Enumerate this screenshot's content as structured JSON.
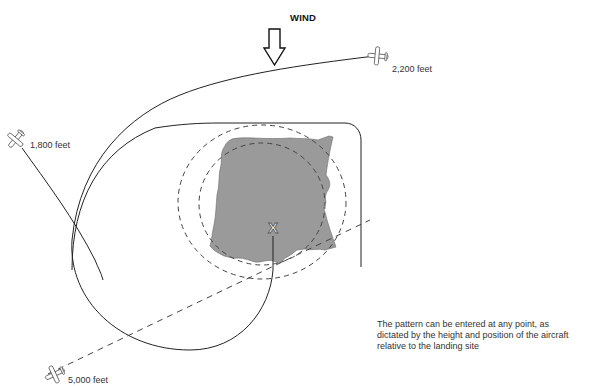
{
  "diagram": {
    "wind": {
      "label": "WIND",
      "direction": "down",
      "icon": "wind-arrow-icon"
    },
    "aircraft": [
      {
        "id": "a1",
        "altitude_label": "1,800 feet",
        "icon": "airplane-icon"
      },
      {
        "id": "a2",
        "altitude_label": "2,200 feet",
        "icon": "airplane-icon"
      },
      {
        "id": "a3",
        "altitude_label": "5,000 feet",
        "icon": "airplane-icon"
      }
    ],
    "landing_site": {
      "marker": "X",
      "fill_color": "#9a9a9a"
    },
    "caption": {
      "lines": [
        "The pattern can be entered at any point, as",
        "dictated by the height and position of the aircraft",
        "relative to the landing site"
      ]
    },
    "colors": {
      "line": "#222222",
      "dashed": "#444444",
      "field": "#9a9a9a",
      "text": "#333333"
    }
  }
}
